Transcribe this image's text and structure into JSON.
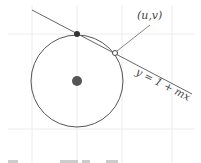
{
  "diagram": {
    "labels": {
      "point": "(u,v)",
      "line_equation": "y = 1 + mx"
    },
    "colors": {
      "grid": "#e8e8e8",
      "stroke": "#555555",
      "dot": "#333333",
      "center_dot": "#555555",
      "text": "#444444"
    },
    "circle": {
      "cx": 77,
      "cy": 81,
      "r": 46
    },
    "center_point": {
      "cx": 77,
      "cy": 81,
      "r": 5
    },
    "top_point": {
      "cx": 77,
      "cy": 34,
      "r": 3
    },
    "intersection_point": {
      "cx": 115,
      "cy": 53,
      "r": 2.5
    },
    "line": {
      "x1": 32,
      "y1": 10,
      "x2": 192,
      "y2": 94
    },
    "leader": {
      "x1": 117,
      "y1": 51,
      "x2": 150,
      "y2": 25
    },
    "grid": {
      "vertical_x": [
        32,
        77,
        122,
        172
      ],
      "horizontal_y": [
        34,
        129
      ]
    }
  }
}
